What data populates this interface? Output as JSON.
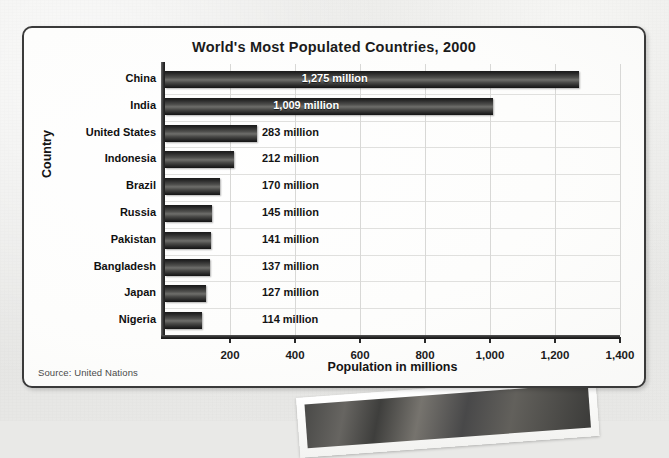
{
  "panel": {
    "title": "World's Most Populated Countries, 2000",
    "source_note": "Source: United Nations",
    "border_color": "#3a3a3a",
    "background_color": "#fdfdfc"
  },
  "chart_data": {
    "type": "bar",
    "orientation": "horizontal",
    "title": "World's Most Populated Countries, 2000",
    "xlabel": "Population in millions",
    "ylabel": "Country",
    "xlim": [
      0,
      1400
    ],
    "grid": true,
    "legend": "none",
    "unit_suffix": "million",
    "bar_color": "#3a3a38",
    "categories": [
      "China",
      "India",
      "United States",
      "Indonesia",
      "Brazil",
      "Russia",
      "Pakistan",
      "Bangladesh",
      "Japan",
      "Nigeria"
    ],
    "values": [
      1275,
      1009,
      283,
      212,
      170,
      145,
      141,
      137,
      127,
      114
    ],
    "value_labels": [
      "1,275 million",
      "1,009 million",
      "283 million",
      "212 million",
      "170 million",
      "145 million",
      "141 million",
      "137 million",
      "127 million",
      "114 million"
    ],
    "label_placement": [
      "inside",
      "inside",
      "outside",
      "outside",
      "outside",
      "outside",
      "outside",
      "outside",
      "outside",
      "outside"
    ],
    "xticks": [
      200,
      400,
      600,
      800,
      1000,
      1200,
      1400
    ],
    "xtick_labels": [
      "200",
      "400",
      "600",
      "800",
      "1,000",
      "1,200",
      "1,400"
    ]
  }
}
